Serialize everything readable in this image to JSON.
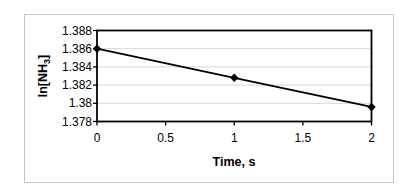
{
  "chart_data": {
    "type": "line",
    "title": "",
    "xlabel": "Time, s",
    "ylabel": "ln[NH3]",
    "ylabel_parts": {
      "main": "ln[NH",
      "sub": "3",
      "end": "]"
    },
    "x": [
      0,
      1,
      2
    ],
    "y": [
      1.386,
      1.3828,
      1.3796
    ],
    "series_name": "ln[NH3] vs time",
    "x_ticks": [
      {
        "v": 0,
        "label": "0"
      },
      {
        "v": 0.5,
        "label": "0.5"
      },
      {
        "v": 1,
        "label": "1"
      },
      {
        "v": 1.5,
        "label": "1.5"
      },
      {
        "v": 2,
        "label": "2"
      }
    ],
    "y_ticks": [
      {
        "v": 1.378,
        "label": "1.378"
      },
      {
        "v": 1.38,
        "label": "1.38"
      },
      {
        "v": 1.382,
        "label": "1.382"
      },
      {
        "v": 1.384,
        "label": "1.384"
      },
      {
        "v": 1.386,
        "label": "1.386"
      },
      {
        "v": 1.388,
        "label": "1.388"
      }
    ],
    "xlim": [
      0,
      2
    ],
    "ylim": [
      1.378,
      1.388
    ],
    "grid": true,
    "legend": false,
    "marker": "diamond",
    "line_color": "#000000",
    "marker_color": "#000000",
    "grid_color": "#d6d6d6",
    "plot_border_color": "#000000",
    "frame_border_color": "#c6c6c6",
    "background_color": "#ffffff"
  }
}
